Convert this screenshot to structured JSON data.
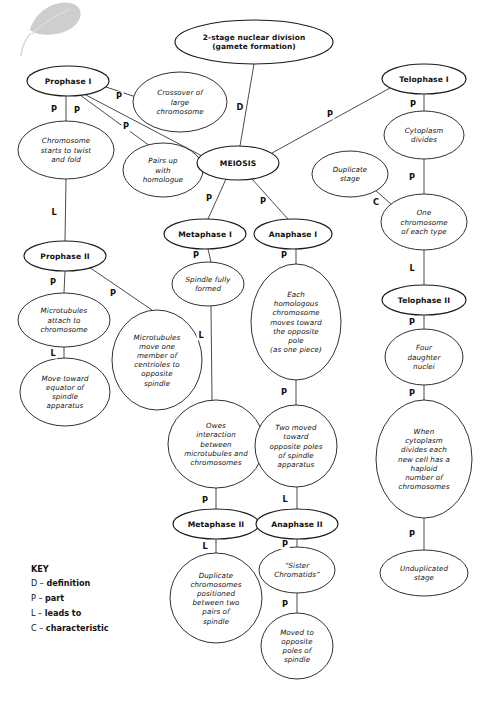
{
  "document": {
    "title": "Meiosis Concept Map",
    "background_color": "#ffffff",
    "ink_color": "#111111"
  },
  "watermark": {
    "name": "leaf-watermark",
    "color": "#8d8d8d"
  },
  "nodes": [
    {
      "id": "title",
      "label": "2-stage nuclear division\n(gamete formation)",
      "lines": [
        "2-stage nuclear division",
        "(gamete formation)"
      ],
      "style": "title",
      "cx": 254,
      "cy": 42,
      "rx": 79,
      "ry": 22
    },
    {
      "id": "prophase1",
      "label": "Prophase I",
      "lines": [
        "Prophase I"
      ],
      "style": "heading",
      "cx": 68,
      "cy": 81,
      "rx": 41,
      "ry": 15
    },
    {
      "id": "crossover",
      "label": "Crossover of large chromosome",
      "lines": [
        "Crossover of",
        "large",
        "chromosome"
      ],
      "style": "normal",
      "cx": 180,
      "cy": 102,
      "rx": 47,
      "ry": 30
    },
    {
      "id": "telophase1",
      "label": "Telophase I",
      "lines": [
        "Telophase I"
      ],
      "style": "heading",
      "cx": 424,
      "cy": 79,
      "rx": 42,
      "ry": 15
    },
    {
      "id": "chromtwist",
      "label": "Chromosome starts to twist and fold",
      "lines": [
        "Chromosome",
        "starts to twist",
        "and fold"
      ],
      "style": "normal",
      "cx": 66,
      "cy": 150,
      "rx": 48,
      "ry": 29
    },
    {
      "id": "pairsup",
      "label": "Pairs up with homologue",
      "lines": [
        "Pairs up",
        "with",
        "homologue"
      ],
      "style": "normal",
      "cx": 163,
      "cy": 170,
      "rx": 40,
      "ry": 27
    },
    {
      "id": "meiosis",
      "label": "MEIOSIS",
      "lines": [
        "MEIOSIS"
      ],
      "style": "heading",
      "cx": 238,
      "cy": 163,
      "rx": 41,
      "ry": 17
    },
    {
      "id": "cytoplasm1",
      "label": "Cytoplasm divides",
      "lines": [
        "Cytoplasm",
        "divides"
      ],
      "style": "normal",
      "cx": 424,
      "cy": 135,
      "rx": 40,
      "ry": 24
    },
    {
      "id": "duplicate",
      "label": "Duplicate stage",
      "lines": [
        "Duplicate",
        "stage"
      ],
      "style": "normal",
      "cx": 350,
      "cy": 174,
      "rx": 38,
      "ry": 23
    },
    {
      "id": "onechrom",
      "label": "One chromosome of each type",
      "lines": [
        "One",
        "chromosome",
        "of each type"
      ],
      "style": "normal",
      "cx": 424,
      "cy": 222,
      "rx": 43,
      "ry": 28
    },
    {
      "id": "metaphase1",
      "label": "Metaphase I",
      "lines": [
        "Metaphase I"
      ],
      "style": "heading",
      "cx": 205,
      "cy": 234,
      "rx": 41,
      "ry": 15
    },
    {
      "id": "anaphase1",
      "label": "Anaphase I",
      "lines": [
        "Anaphase I"
      ],
      "style": "heading",
      "cx": 293,
      "cy": 234,
      "rx": 39,
      "ry": 15
    },
    {
      "id": "prophase2",
      "label": "Prophase II",
      "lines": [
        "Prophase II"
      ],
      "style": "heading",
      "cx": 65,
      "cy": 256,
      "rx": 41,
      "ry": 15
    },
    {
      "id": "spindleformed",
      "label": "Spindle fully formed",
      "lines": [
        "Spindle fully",
        "formed"
      ],
      "style": "normal",
      "cx": 208,
      "cy": 284,
      "rx": 36,
      "ry": 22
    },
    {
      "id": "telophase2",
      "label": "Telophase II",
      "lines": [
        "Telophase II"
      ],
      "style": "heading",
      "cx": 424,
      "cy": 300,
      "rx": 42,
      "ry": 15
    },
    {
      "id": "microtattach",
      "label": "Microtubules attach to chromosome",
      "lines": [
        "Microtubules",
        "attach to",
        "chromosome"
      ],
      "style": "normal",
      "cx": 64,
      "cy": 320,
      "rx": 46,
      "ry": 27
    },
    {
      "id": "eachhomolog",
      "label": "Each homologous chromosome moves toward the opposite pole (as one piece)",
      "lines": [
        "Each",
        "homologous",
        "chromosome",
        "moves toward",
        "the opposite",
        "pole",
        "(as one piece)"
      ],
      "style": "normal",
      "cx": 296,
      "cy": 322,
      "rx": 45,
      "ry": 58
    },
    {
      "id": "microtmove",
      "label": "Microtubules move one member of centrioles to opposite spindle",
      "lines": [
        "Microtubules",
        "move one",
        "member of",
        "centrioles to",
        "opposite",
        "spindle"
      ],
      "style": "normal",
      "cx": 157,
      "cy": 360,
      "rx": 45,
      "ry": 50
    },
    {
      "id": "fourdaughter",
      "label": "Four daughter nuclei",
      "lines": [
        "Four",
        "daughter",
        "nuclei"
      ],
      "style": "normal",
      "cx": 424,
      "cy": 357,
      "rx": 39,
      "ry": 28
    },
    {
      "id": "movetoward",
      "label": "Move toward equator of spindle apparatus",
      "lines": [
        "Move toward",
        "equator of",
        "spindle",
        "apparatus"
      ],
      "style": "normal",
      "cx": 65,
      "cy": 392,
      "rx": 45,
      "ry": 34
    },
    {
      "id": "owesinteract",
      "label": "Owes interaction between microtubules and chromosomes",
      "lines": [
        "Owes",
        "interaction",
        "between",
        "microtubules and",
        "chromosomes"
      ],
      "style": "normal",
      "cx": 216,
      "cy": 444,
      "rx": 48,
      "ry": 44
    },
    {
      "id": "twomoved",
      "label": "Two moved toward opposite poles of spindle apparatus",
      "lines": [
        "Two moved",
        "toward",
        "opposite poles",
        "of spindle",
        "apparatus"
      ],
      "style": "normal",
      "cx": 296,
      "cy": 446,
      "rx": 41,
      "ry": 41
    },
    {
      "id": "whencytoplasm",
      "label": "When cytoplasm divides each new cell has a haploid number of chromosomes",
      "lines": [
        "When",
        "cytoplasm",
        "divides each",
        "new cell has a",
        "haploid",
        "number of",
        "chromosomes"
      ],
      "style": "normal",
      "cx": 424,
      "cy": 459,
      "rx": 48,
      "ry": 59
    },
    {
      "id": "metaphase2",
      "label": "Metaphase II",
      "lines": [
        "Metaphase II"
      ],
      "style": "heading",
      "cx": 216,
      "cy": 524,
      "rx": 43,
      "ry": 15
    },
    {
      "id": "anaphase2",
      "label": "Anaphase II",
      "lines": [
        "Anaphase II"
      ],
      "style": "heading",
      "cx": 297,
      "cy": 524,
      "rx": 41,
      "ry": 15
    },
    {
      "id": "dupchrom",
      "label": "Duplicate chromosomes positioned between two pairs of spindle",
      "lines": [
        "Duplicate",
        "chromosomes",
        "positioned",
        "between two",
        "pairs of",
        "spindle"
      ],
      "style": "normal",
      "cx": 216,
      "cy": 598,
      "rx": 46,
      "ry": 45
    },
    {
      "id": "sisterchrom",
      "label": "“Sister Chromatids”",
      "lines": [
        "“Sister",
        "Chromatids”"
      ],
      "style": "normal",
      "cx": 297,
      "cy": 570,
      "rx": 38,
      "ry": 23
    },
    {
      "id": "unduplicated",
      "label": "Unduplicated stage",
      "lines": [
        "Unduplicated",
        "stage"
      ],
      "style": "normal",
      "cx": 424,
      "cy": 573,
      "rx": 44,
      "ry": 23
    },
    {
      "id": "movedopposite",
      "label": "Moved to opposite poles of spindle",
      "lines": [
        "Moved to",
        "opposite",
        "poles of",
        "spindle"
      ],
      "style": "normal",
      "cx": 297,
      "cy": 646,
      "rx": 36,
      "ry": 33
    }
  ],
  "edges": [
    {
      "from": "title",
      "to": "meiosis",
      "label": "D",
      "x1": 254,
      "y1": 64,
      "x2": 240,
      "y2": 146,
      "lx": 240,
      "ly": 110
    },
    {
      "from": "prophase1",
      "to": "chromtwist",
      "label": "P",
      "x1": 66,
      "y1": 96,
      "x2": 66,
      "y2": 121,
      "lx": 54,
      "ly": 112
    },
    {
      "from": "prophase1",
      "to": "pairsup",
      "label": "P",
      "x1": 80,
      "y1": 95,
      "x2": 150,
      "y2": 146,
      "lx": 77,
      "ly": 113
    },
    {
      "from": "prophase1",
      "to": "crossover",
      "label": "P",
      "x1": 106,
      "y1": 87,
      "x2": 136,
      "y2": 97,
      "lx": 119,
      "ly": 99
    },
    {
      "from": "prophase1",
      "to": "meiosis",
      "label": "P",
      "x1": 84,
      "y1": 94,
      "x2": 204,
      "y2": 157,
      "lx": 126,
      "ly": 129
    },
    {
      "from": "telophase1",
      "to": "cytoplasm1",
      "label": "P",
      "x1": 424,
      "y1": 94,
      "x2": 424,
      "y2": 111,
      "lx": 413,
      "ly": 107
    },
    {
      "from": "telophase1",
      "to": "meiosis",
      "label": "P",
      "x1": 390,
      "y1": 88,
      "x2": 272,
      "y2": 153,
      "lx": 330,
      "ly": 117
    },
    {
      "from": "cytoplasm1",
      "to": "onechrom",
      "label": "P",
      "x1": 424,
      "y1": 159,
      "x2": 424,
      "y2": 194,
      "lx": 412,
      "ly": 180
    },
    {
      "from": "duplicate",
      "to": "onechrom",
      "label": "C",
      "x1": 374,
      "y1": 189,
      "x2": 392,
      "y2": 205,
      "lx": 376,
      "ly": 205
    },
    {
      "from": "meiosis",
      "to": "metaphase1",
      "label": "P",
      "x1": 226,
      "y1": 179,
      "x2": 208,
      "y2": 219,
      "lx": 209,
      "ly": 201
    },
    {
      "from": "meiosis",
      "to": "anaphase1",
      "label": "P",
      "x1": 252,
      "y1": 179,
      "x2": 288,
      "y2": 219,
      "lx": 263,
      "ly": 204
    },
    {
      "from": "chromtwist",
      "to": "prophase2",
      "label": "L",
      "x1": 66,
      "y1": 179,
      "x2": 65,
      "y2": 241,
      "lx": 54,
      "ly": 215
    },
    {
      "from": "metaphase1",
      "to": "spindleformed",
      "label": "P",
      "x1": 208,
      "y1": 249,
      "x2": 211,
      "y2": 262,
      "lx": 196,
      "ly": 258
    },
    {
      "from": "anaphase1",
      "to": "eachhomolog",
      "label": "P",
      "x1": 296,
      "y1": 249,
      "x2": 296,
      "y2": 264,
      "lx": 284,
      "ly": 258
    },
    {
      "from": "prophase2",
      "to": "microtattach",
      "label": "P",
      "x1": 65,
      "y1": 271,
      "x2": 64,
      "y2": 293,
      "lx": 53,
      "ly": 285
    },
    {
      "from": "prophase2",
      "to": "microtmove",
      "label": "P",
      "x1": 86,
      "y1": 265,
      "x2": 152,
      "y2": 310,
      "lx": 113,
      "ly": 296
    },
    {
      "from": "onechrom",
      "to": "telophase2",
      "label": "L",
      "x1": 424,
      "y1": 250,
      "x2": 424,
      "y2": 285,
      "lx": 412,
      "ly": 271
    },
    {
      "from": "spindleformed",
      "to": "owesinteract",
      "label": "L",
      "x1": 211,
      "y1": 306,
      "x2": 212,
      "y2": 400,
      "lx": 201,
      "ly": 338
    },
    {
      "from": "microtattach",
      "to": "movetoward",
      "label": "L",
      "x1": 64,
      "y1": 347,
      "x2": 64,
      "y2": 358,
      "lx": 53,
      "ly": 356
    },
    {
      "from": "telophase2",
      "to": "fourdaughter",
      "label": "P",
      "x1": 424,
      "y1": 315,
      "x2": 424,
      "y2": 329,
      "lx": 412,
      "ly": 325
    },
    {
      "from": "eachhomolog",
      "to": "twomoved",
      "label": "P",
      "x1": 296,
      "y1": 380,
      "x2": 296,
      "y2": 405,
      "lx": 284,
      "ly": 395
    },
    {
      "from": "fourdaughter",
      "to": "whencytoplasm",
      "label": "P",
      "x1": 424,
      "y1": 385,
      "x2": 424,
      "y2": 400,
      "lx": 412,
      "ly": 396
    },
    {
      "from": "owesinteract",
      "to": "metaphase2",
      "label": "P",
      "x1": 216,
      "y1": 488,
      "x2": 216,
      "y2": 509,
      "lx": 205,
      "ly": 503
    },
    {
      "from": "twomoved",
      "to": "anaphase2",
      "label": "L",
      "x1": 297,
      "y1": 487,
      "x2": 297,
      "y2": 509,
      "lx": 285,
      "ly": 502
    },
    {
      "from": "metaphase2",
      "to": "dupchrom",
      "label": "L",
      "x1": 216,
      "y1": 539,
      "x2": 216,
      "y2": 553,
      "lx": 205,
      "ly": 549
    },
    {
      "from": "anaphase2",
      "to": "sisterchrom",
      "label": "P",
      "x1": 297,
      "y1": 539,
      "x2": 297,
      "y2": 547,
      "lx": 285,
      "ly": 547
    },
    {
      "from": "whencytoplasm",
      "to": "unduplicated",
      "label": "P",
      "x1": 424,
      "y1": 518,
      "x2": 424,
      "y2": 550,
      "lx": 412,
      "ly": 537
    },
    {
      "from": "sisterchrom",
      "to": "movedopposite",
      "label": "P",
      "x1": 297,
      "y1": 593,
      "x2": 297,
      "y2": 613,
      "lx": 285,
      "ly": 607
    }
  ],
  "key": {
    "title": "KEY",
    "entries": [
      {
        "code": "D",
        "dash": "–",
        "meaning": "definition"
      },
      {
        "code": "P",
        "dash": "–",
        "meaning": "part"
      },
      {
        "code": "L",
        "dash": "–",
        "meaning": "leads to"
      },
      {
        "code": "C",
        "dash": "–",
        "meaning": "characteristic"
      }
    ]
  }
}
